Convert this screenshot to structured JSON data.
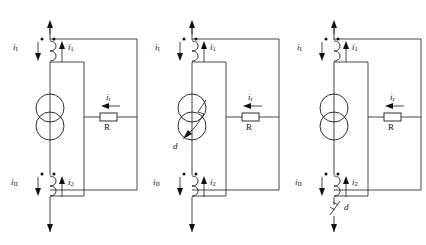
{
  "figure": {
    "type": "circuit-diagram",
    "title": "",
    "panel_count": 3
  },
  "labels": {
    "current_primary_top": "i",
    "current_primary_top_sub": "I",
    "current_secondary_top": "i",
    "current_secondary_top_sub": "1",
    "current_primary_bottom": "i",
    "current_primary_bottom_sub": "II",
    "current_secondary_bottom": "i",
    "current_secondary_bottom_sub": "2",
    "current_resistor": "i",
    "current_resistor_sub": "r",
    "resistor": "R",
    "fault": "d"
  },
  "panels": [
    {
      "name": "panel-normal",
      "index": 1,
      "source_type": "current-source",
      "fault_marker": null,
      "fault_label": "",
      "labels": {
        "i_I": "i",
        "i_I_sub": "I",
        "i_1": "i",
        "i_1_sub": "1",
        "i_II": "i",
        "i_II_sub": "II",
        "i_2": "i",
        "i_2_sub": "2",
        "i_r": "i",
        "i_r_sub": "r",
        "R": "R"
      }
    },
    {
      "name": "panel-internal-fault",
      "index": 2,
      "source_type": "current-source-with-fault-arrow",
      "fault_marker": "diagonal-arrow-through-source",
      "fault_label": "d",
      "labels": {
        "i_I": "i",
        "i_I_sub": "I",
        "i_1": "i",
        "i_1_sub": "1",
        "i_II": "i",
        "i_II_sub": "II",
        "i_2": "i",
        "i_2_sub": "2",
        "i_r": "i",
        "i_r_sub": "r",
        "R": "R"
      }
    },
    {
      "name": "panel-external-fault",
      "index": 3,
      "source_type": "current-source",
      "fault_marker": "lightning-fault-symbol-bottom",
      "fault_label": "d",
      "labels": {
        "i_I": "i",
        "i_I_sub": "I",
        "i_1": "i",
        "i_1_sub": "1",
        "i_II": "i",
        "i_II_sub": "II",
        "i_2": "i",
        "i_2_sub": "2",
        "i_r": "i",
        "i_r_sub": "r",
        "R": "R"
      }
    }
  ],
  "colors": {
    "line": "#1a1a1a",
    "background": "#ffffff",
    "text": "#111111"
  }
}
